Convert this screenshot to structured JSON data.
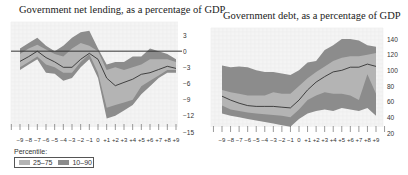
{
  "chart_data": [
    {
      "type": "area",
      "title": "Government net lending, as a percentage of GDP",
      "xlabel": "",
      "ylabel": "",
      "x": [
        "-9",
        "-8",
        "-7",
        "-6",
        "-5",
        "-4",
        "-3",
        "-2",
        "-1",
        "0",
        "+1",
        "+2",
        "+3",
        "+4",
        "+5",
        "+6",
        "+7",
        "+8",
        "+9"
      ],
      "ylim": [
        -15,
        4
      ],
      "yticks": [
        3,
        0,
        -3,
        -6,
        -9,
        -12,
        -15
      ],
      "reference_line": 0,
      "grid": true,
      "series": [
        {
          "name": "10th percentile",
          "values": [
            -3.5,
            -2.5,
            -1.5,
            -4.0,
            -4.2,
            -5.5,
            -5.0,
            -3.0,
            -1.5,
            -5.0,
            -12.5,
            -12.0,
            -11.0,
            -10.0,
            -8.0,
            -6.5,
            -5.0,
            -4.0,
            -4.0
          ]
        },
        {
          "name": "25th percentile",
          "values": [
            -3.0,
            -2.0,
            -1.0,
            -2.5,
            -3.0,
            -4.0,
            -4.0,
            -2.0,
            -0.5,
            -4.0,
            -10.5,
            -10.0,
            -9.5,
            -9.0,
            -6.5,
            -5.5,
            -4.5,
            -3.5,
            -3.5
          ]
        },
        {
          "name": "Median",
          "values": [
            -1.9,
            -1.0,
            0.0,
            -1.2,
            -2.0,
            -3.0,
            -3.0,
            -1.5,
            -0.4,
            -1.5,
            -5.0,
            -6.4,
            -5.8,
            -5.2,
            -4.3,
            -4.0,
            -3.4,
            -2.8,
            -3.2
          ]
        },
        {
          "name": "75th percentile",
          "values": [
            -0.5,
            0.5,
            1.2,
            0.3,
            -0.5,
            -1.0,
            0.5,
            1.5,
            1.0,
            0.0,
            -3.5,
            -3.0,
            -3.5,
            -3.0,
            -2.5,
            -1.5,
            -1.5,
            -1.5,
            -2.0
          ]
        },
        {
          "name": "90th percentile",
          "values": [
            0.5,
            1.5,
            2.5,
            1.0,
            0.0,
            1.0,
            2.5,
            3.5,
            3.8,
            0.5,
            -2.5,
            -2.0,
            -2.0,
            -1.0,
            -1.0,
            0.5,
            0.0,
            -0.5,
            -1.5
          ]
        }
      ]
    },
    {
      "type": "area",
      "title": "Government debt, as a percentage of GDP",
      "xlabel": "",
      "ylabel": "",
      "x": [
        "-9",
        "-8",
        "-7",
        "-6",
        "-5",
        "-4",
        "-3",
        "-2",
        "-1",
        "0",
        "+1",
        "+2",
        "+3",
        "+4",
        "+5",
        "+6",
        "+7",
        "+8",
        "+9"
      ],
      "ylim": [
        20,
        145
      ],
      "yticks": [
        140,
        120,
        100,
        80,
        60,
        40,
        20
      ],
      "grid": true,
      "series": [
        {
          "name": "10th percentile",
          "values": [
            45,
            42,
            40,
            38,
            36,
            34,
            32,
            30,
            28,
            38,
            45,
            48,
            50,
            48,
            52,
            50,
            48,
            52,
            42
          ]
        },
        {
          "name": "25th percentile",
          "values": [
            55,
            50,
            48,
            46,
            45,
            44,
            43,
            42,
            40,
            50,
            62,
            68,
            72,
            70,
            70,
            68,
            62,
            95,
            70
          ]
        },
        {
          "name": "Median",
          "values": [
            67,
            62,
            58,
            55,
            54,
            54,
            54,
            53,
            52,
            62,
            75,
            85,
            92,
            98,
            100,
            104,
            104,
            108,
            105
          ]
        },
        {
          "name": "75th percentile",
          "values": [
            75,
            72,
            70,
            68,
            68,
            68,
            72,
            70,
            70,
            80,
            90,
            98,
            105,
            112,
            116,
            118,
            118,
            120,
            122
          ]
        },
        {
          "name": "90th percentile",
          "values": [
            106,
            104,
            105,
            104,
            100,
            98,
            98,
            96,
            94,
            100,
            110,
            112,
            126,
            132,
            140,
            140,
            138,
            132,
            130
          ]
        }
      ]
    }
  ],
  "legend": {
    "title": "Percentile:",
    "items": [
      {
        "label": "25–75",
        "color": "#b4b4b4"
      },
      {
        "label": "10–90",
        "color": "#8c8c8c"
      }
    ]
  },
  "colors": {
    "inner_band": "#b4b4b4",
    "outer_band": "#8c8c8c",
    "median": "#333333",
    "grid": "#ececec",
    "plot_bg": "#f4f4f4"
  }
}
